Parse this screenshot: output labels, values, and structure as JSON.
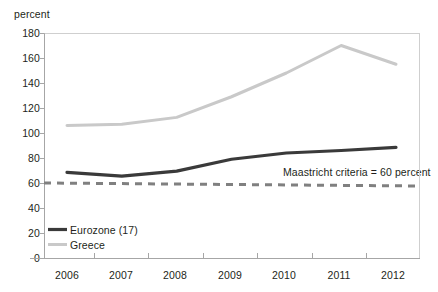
{
  "chart_data": {
    "type": "line",
    "title": "",
    "ylabel": "percent",
    "xlabel": "",
    "x": [
      "2006",
      "2007",
      "2008",
      "2009",
      "2010",
      "2011",
      "2012"
    ],
    "categories": [
      "2006",
      "2007",
      "2008",
      "2009",
      "2010",
      "2011",
      "2012"
    ],
    "series": [
      {
        "name": "Eurozone (17)",
        "color": "#3a3a3a",
        "style": "solid",
        "values": [
          68.5,
          65.5,
          69.5,
          79,
          84,
          86,
          88.5
        ]
      },
      {
        "name": "Greece",
        "color": "#c9c9c9",
        "style": "solid",
        "values": [
          106,
          107,
          112.5,
          129,
          148,
          170,
          155
        ]
      },
      {
        "name": "Maastricht criteria = 60 percent",
        "color": "#808080",
        "style": "dashed",
        "values": [
          60,
          60,
          60,
          60,
          60,
          60,
          60
        ]
      }
    ],
    "ylim": [
      0,
      180
    ],
    "ytick_values": [
      0,
      20,
      40,
      60,
      80,
      100,
      120,
      140,
      160,
      180
    ],
    "ytick_labels": [
      "0",
      "20",
      "40",
      "60",
      "80",
      "100",
      "120",
      "140",
      "160",
      "180"
    ],
    "xtick_labels": [
      "2006",
      "2007",
      "2008",
      "2009",
      "2010",
      "2011",
      "2012"
    ],
    "grid": false,
    "legend_position": "bottom-left",
    "annotations": [
      {
        "text": "Maastricht criteria = 60 percent",
        "x_value": 2010.55,
        "y_value": 68
      }
    ]
  },
  "axis": {
    "y_title": "percent",
    "y_ticks": [
      "180",
      "160",
      "140",
      "120",
      "100",
      "80",
      "60",
      "40",
      "20",
      "0"
    ],
    "x_ticks": [
      "2006",
      "2007",
      "2008",
      "2009",
      "2010",
      "2011",
      "2012"
    ]
  },
  "legend": {
    "items": [
      {
        "label": "Eurozone (17)",
        "color": "#3a3a3a"
      },
      {
        "label": "Greece",
        "color": "#c9c9c9"
      }
    ]
  },
  "annotation": {
    "maastricht": "Maastricht criteria = 60 percent"
  },
  "colors": {
    "eurozone": "#3a3a3a",
    "greece": "#c9c9c9",
    "maastricht": "#808080",
    "axis": "#a6a6a6",
    "text": "#231f20",
    "background": "#ffffff"
  }
}
